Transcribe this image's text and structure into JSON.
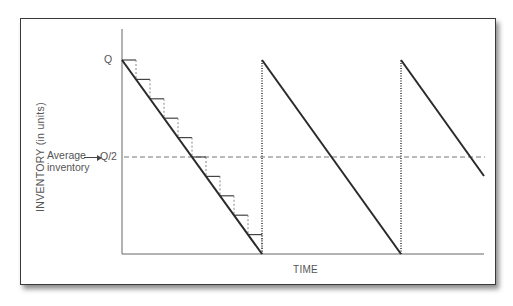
{
  "diagram": {
    "type": "EOQ inventory sawtooth diagram",
    "y_axis_label": "INVENTORY (in units)",
    "x_axis_label": "TIME",
    "q_label": "Q",
    "half_q_label": "Q/2",
    "average_label_line1": "Average",
    "average_label_line2": "inventory",
    "cycles": 3,
    "steps_in_first_cycle": 10,
    "colors": {
      "line": "#2a2a2a",
      "axis": "#666666",
      "dashed": "#777777",
      "text": "#555555",
      "frame": "#3a3a3a"
    }
  }
}
